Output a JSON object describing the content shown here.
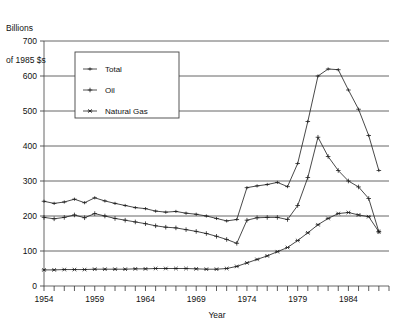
{
  "axis_label_block": {
    "line1": "Billions",
    "line2": "of 1985 $s"
  },
  "legend": {
    "items": [
      {
        "label": "Total",
        "marker": "dash-tick-marker"
      },
      {
        "label": "Oil",
        "marker": "plus-marker"
      },
      {
        "label": "Natural Gas",
        "marker": "x-star-marker"
      }
    ]
  },
  "chart_data": {
    "type": "line",
    "title": "",
    "subtitle": "",
    "xlabel": "Year",
    "ylabel": "Billions of 1985 $s",
    "xlim": [
      1954,
      1988
    ],
    "ylim": [
      0,
      700
    ],
    "grid": true,
    "legend_position": "upper-left-inside",
    "ytick_labels": [
      "0",
      "100",
      "200",
      "300",
      "400",
      "500",
      "600",
      "700"
    ],
    "yticks": [
      0,
      100,
      200,
      300,
      400,
      500,
      600,
      700
    ],
    "xtick_labels": [
      "1954",
      "1959",
      "1964",
      "1969",
      "1974",
      "1979",
      "1984"
    ],
    "xticks": [
      1954,
      1959,
      1964,
      1969,
      1974,
      1979,
      1984
    ],
    "xtick_minor_step": 1,
    "x": [
      1954,
      1955,
      1956,
      1957,
      1958,
      1959,
      1960,
      1961,
      1962,
      1963,
      1964,
      1965,
      1966,
      1967,
      1968,
      1969,
      1970,
      1971,
      1972,
      1973,
      1974,
      1975,
      1976,
      1977,
      1978,
      1979,
      1980,
      1981,
      1982,
      1983,
      1984,
      1985,
      1986,
      1987
    ],
    "series": [
      {
        "name": "Total",
        "values": [
          242,
          236,
          240,
          248,
          238,
          252,
          243,
          236,
          230,
          224,
          221,
          214,
          211,
          213,
          208,
          205,
          200,
          193,
          186,
          190,
          281,
          286,
          290,
          296,
          284,
          350,
          470,
          600,
          620,
          618,
          560,
          505,
          430,
          330
        ]
      },
      {
        "name": "Oil",
        "values": [
          196,
          192,
          196,
          203,
          195,
          207,
          200,
          193,
          188,
          183,
          178,
          172,
          168,
          166,
          161,
          156,
          150,
          142,
          133,
          122,
          188,
          195,
          196,
          196,
          190,
          230,
          310,
          425,
          370,
          330,
          300,
          283,
          250,
          155
        ]
      },
      {
        "name": "Natural Gas",
        "values": [
          46,
          46,
          47,
          47,
          47,
          48,
          48,
          48,
          48,
          49,
          49,
          50,
          50,
          50,
          50,
          49,
          48,
          48,
          50,
          56,
          66,
          76,
          86,
          98,
          110,
          130,
          152,
          175,
          193,
          207,
          210,
          203,
          198,
          155
        ]
      }
    ]
  }
}
